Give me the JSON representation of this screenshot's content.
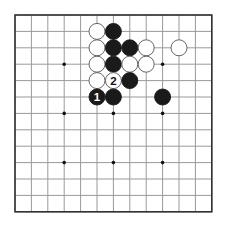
{
  "board": {
    "size": 13,
    "origin_x": 15,
    "origin_y": 15,
    "cell": 16.4,
    "line_color": "#9a9a9a",
    "border_color": "#333333",
    "star_points": [
      [
        3,
        3
      ],
      [
        6,
        3
      ],
      [
        9,
        3
      ],
      [
        3,
        6
      ],
      [
        6,
        6
      ],
      [
        9,
        6
      ],
      [
        3,
        9
      ],
      [
        6,
        9
      ],
      [
        9,
        9
      ]
    ]
  },
  "stones": [
    {
      "col": 5,
      "row": 1,
      "color": "white"
    },
    {
      "col": 6,
      "row": 1,
      "color": "black"
    },
    {
      "col": 5,
      "row": 2,
      "color": "white"
    },
    {
      "col": 6,
      "row": 2,
      "color": "black"
    },
    {
      "col": 7,
      "row": 2,
      "color": "black"
    },
    {
      "col": 8,
      "row": 2,
      "color": "white"
    },
    {
      "col": 10,
      "row": 2,
      "color": "white"
    },
    {
      "col": 5,
      "row": 3,
      "color": "white"
    },
    {
      "col": 6,
      "row": 3,
      "color": "black"
    },
    {
      "col": 7,
      "row": 3,
      "color": "white"
    },
    {
      "col": 8,
      "row": 3,
      "color": "white"
    },
    {
      "col": 5,
      "row": 4,
      "color": "white"
    },
    {
      "col": 6,
      "row": 4,
      "color": "white",
      "label": "2"
    },
    {
      "col": 7,
      "row": 4,
      "color": "black"
    },
    {
      "col": 5,
      "row": 5,
      "color": "black",
      "label": "1"
    },
    {
      "col": 6,
      "row": 5,
      "color": "black"
    },
    {
      "col": 9,
      "row": 5,
      "color": "black"
    }
  ]
}
